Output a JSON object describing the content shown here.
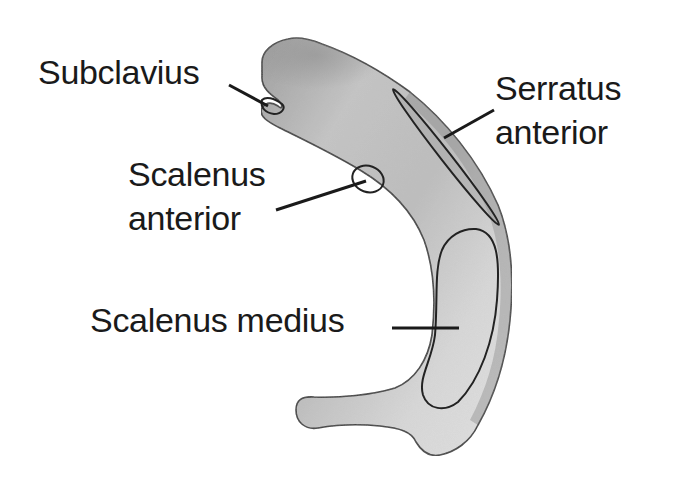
{
  "figure": {
    "colors": {
      "background": "#ffffff",
      "bone_fill_light": "#e4e4e4",
      "bone_fill_dark": "#a8a8a8",
      "outline": "#222222",
      "text": "#1a1a1a"
    }
  },
  "labels": {
    "subclavius": {
      "lines": [
        "Subclavius"
      ]
    },
    "serratus_anterior": {
      "lines": [
        "Serratus",
        "anterior"
      ]
    },
    "scalenus_anterior": {
      "lines": [
        "Scalenus",
        "anterior"
      ]
    },
    "scalenus_medius": {
      "lines": [
        "Scalenus medius"
      ]
    }
  },
  "attachment_sites": [
    {
      "name": "Subclavius",
      "shape": "notch",
      "location": "anterior end"
    },
    {
      "name": "Serratus anterior",
      "shape": "thin elongated ellipse",
      "location": "outer border"
    },
    {
      "name": "Scalenus anterior",
      "shape": "small oval",
      "location": "inner border, scalene tubercle"
    },
    {
      "name": "Scalenus medius",
      "shape": "large elongated oval",
      "location": "posterior shaft"
    }
  ]
}
